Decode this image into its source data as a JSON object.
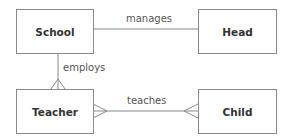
{
  "diagram": {
    "type": "entity-relationship",
    "line_color": "#8a8a8a",
    "entities": [
      {
        "id": "school",
        "label": "School"
      },
      {
        "id": "head",
        "label": "Head"
      },
      {
        "id": "teacher",
        "label": "Teacher"
      },
      {
        "id": "child",
        "label": "Child"
      }
    ],
    "relationships": [
      {
        "from": "school",
        "to": "head",
        "label": "manages",
        "cardinality": "one-to-one"
      },
      {
        "from": "school",
        "to": "teacher",
        "label": "employs",
        "cardinality": "one-to-many"
      },
      {
        "from": "teacher",
        "to": "child",
        "label": "teaches",
        "cardinality": "many-to-many"
      }
    ]
  }
}
